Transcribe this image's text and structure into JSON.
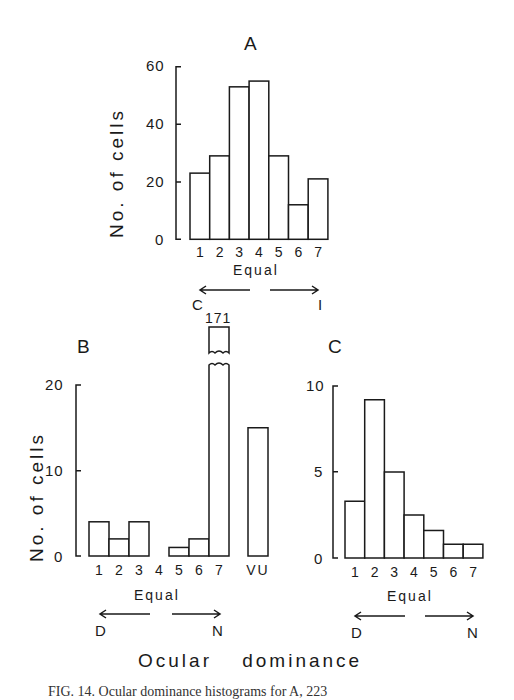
{
  "figure": {
    "xlabel": "Ocular dominance",
    "caption": "FIG. 14. Ocular dominance histograms for A, 223"
  },
  "chart_data": [
    {
      "type": "bar",
      "panel": "A",
      "title": "A",
      "ylabel": "No. of cells",
      "xlabel": "Equal",
      "categories": [
        "1",
        "2",
        "3",
        "4",
        "5",
        "6",
        "7"
      ],
      "values": [
        23,
        29,
        53,
        55,
        29,
        12,
        21
      ],
      "ylim": [
        0,
        60
      ],
      "yticks": [
        0,
        20,
        40,
        60
      ],
      "direction_labels": {
        "left": "C",
        "right": "I"
      },
      "grid": false
    },
    {
      "type": "bar",
      "panel": "B",
      "title": "B",
      "ylabel": "No. of cells",
      "xlabel": "Equal",
      "categories": [
        "1",
        "2",
        "3",
        "4",
        "5",
        "6",
        "7",
        "VU"
      ],
      "values": [
        4,
        2,
        4,
        0,
        1,
        2,
        171,
        15
      ],
      "ylim": [
        0,
        20
      ],
      "yticks": [
        0,
        10,
        20
      ],
      "annotations": [
        {
          "category": "7",
          "text": "171",
          "note": "broken bar, exceeds axis"
        }
      ],
      "direction_labels": {
        "left": "D",
        "right": "N"
      },
      "grid": false
    },
    {
      "type": "bar",
      "panel": "C",
      "title": "C",
      "ylabel": "",
      "xlabel": "Equal",
      "categories": [
        "1",
        "2",
        "3",
        "4",
        "5",
        "6",
        "7"
      ],
      "values": [
        3.3,
        9.2,
        5.0,
        2.5,
        1.6,
        0.8,
        0.8
      ],
      "ylim": [
        0,
        10
      ],
      "yticks": [
        0,
        5,
        10
      ],
      "direction_labels": {
        "left": "D",
        "right": "N"
      },
      "grid": false
    }
  ],
  "labels": {
    "a": {
      "title": "A",
      "ylabel": "No. of cells",
      "equal": "Equal",
      "left": "C",
      "right": "I",
      "yticks": [
        "60",
        "40",
        "20",
        "0"
      ],
      "cats": [
        "1",
        "2",
        "3",
        "4",
        "5",
        "6",
        "7"
      ]
    },
    "b": {
      "title": "B",
      "ylabel": "No. of cells",
      "equal": "Equal",
      "left": "D",
      "right": "N",
      "yticks": [
        "20",
        "10",
        "0"
      ],
      "cats": [
        "1",
        "2",
        "3",
        "4",
        "5",
        "6",
        "7",
        "VU"
      ],
      "break_value": "171"
    },
    "c": {
      "title": "C",
      "equal": "Equal",
      "left": "D",
      "right": "N",
      "yticks": [
        "10",
        "5",
        "0"
      ],
      "cats": [
        "1",
        "2",
        "3",
        "4",
        "5",
        "6",
        "7"
      ]
    }
  }
}
